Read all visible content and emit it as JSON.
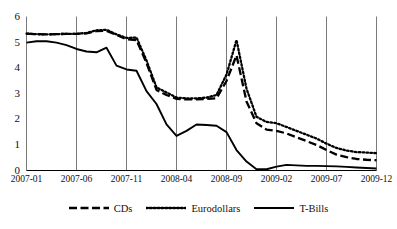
{
  "chart_data": {
    "type": "line",
    "title": "",
    "xlabel": "",
    "ylabel": "",
    "ylim": [
      0,
      6
    ],
    "yticks": [
      0,
      1,
      2,
      3,
      4,
      5,
      6
    ],
    "ytick_labels": [
      "0",
      "1",
      "2",
      "3",
      "4",
      "5",
      "6"
    ],
    "grid": true,
    "grid_axis": "x",
    "legend_position": "bottom-center",
    "x": [
      "2007-01",
      "2007-02",
      "2007-03",
      "2007-04",
      "2007-05",
      "2007-06",
      "2007-07",
      "2007-08",
      "2007-09",
      "2007-10",
      "2007-11",
      "2007-12",
      "2008-01",
      "2008-02",
      "2008-03",
      "2008-04",
      "2008-05",
      "2008-06",
      "2008-07",
      "2008-08",
      "2008-09",
      "2008-10",
      "2008-11",
      "2008-12",
      "2009-01",
      "2009-02",
      "2009-03",
      "2009-04",
      "2009-05",
      "2009-06",
      "2009-07",
      "2009-08",
      "2009-09",
      "2009-10",
      "2009-11",
      "2009-12"
    ],
    "xtick_labels": [
      "2007-01",
      "2007-06",
      "2007-11",
      "2008-04",
      "2008-09",
      "2009-02",
      "2009-07",
      "2009-12"
    ],
    "xtick_positions": [
      0,
      5,
      10,
      15,
      20,
      25,
      30,
      35
    ],
    "series": [
      {
        "name": "CDs",
        "style": "dashed",
        "color": "#000000",
        "values": [
          5.35,
          5.33,
          5.32,
          5.33,
          5.34,
          5.34,
          5.36,
          5.45,
          5.46,
          5.3,
          5.13,
          5.1,
          4.2,
          3.15,
          2.95,
          2.8,
          2.78,
          2.78,
          2.8,
          2.82,
          3.5,
          4.5,
          2.7,
          1.85,
          1.6,
          1.55,
          1.45,
          1.3,
          1.15,
          1.0,
          0.8,
          0.62,
          0.52,
          0.45,
          0.42,
          0.4
        ]
      },
      {
        "name": "Eurodollars",
        "style": "dotted",
        "color": "#000000",
        "values": [
          5.35,
          5.33,
          5.32,
          5.33,
          5.34,
          5.34,
          5.38,
          5.48,
          5.5,
          5.32,
          5.18,
          5.2,
          4.3,
          3.25,
          3.05,
          2.85,
          2.82,
          2.82,
          2.85,
          2.95,
          3.75,
          5.1,
          3.2,
          2.1,
          1.9,
          1.85,
          1.7,
          1.55,
          1.4,
          1.25,
          1.05,
          0.88,
          0.78,
          0.72,
          0.7,
          0.68
        ]
      },
      {
        "name": "T-Bills",
        "style": "solid",
        "color": "#000000",
        "values": [
          5.0,
          5.05,
          5.05,
          5.0,
          4.9,
          4.75,
          4.65,
          4.62,
          4.8,
          4.1,
          3.95,
          3.9,
          3.1,
          2.6,
          1.8,
          1.35,
          1.55,
          1.8,
          1.78,
          1.75,
          1.5,
          0.8,
          0.35,
          0.05,
          0.05,
          0.15,
          0.22,
          0.2,
          0.18,
          0.18,
          0.17,
          0.16,
          0.14,
          0.12,
          0.1,
          0.08
        ]
      }
    ]
  },
  "legend": {
    "entries": [
      {
        "label": "CDs",
        "style": "dashed"
      },
      {
        "label": "Eurodollars",
        "style": "dotted"
      },
      {
        "label": "T-Bills",
        "style": "solid"
      }
    ]
  },
  "axes": {
    "y_axis_name": "y-axis",
    "x_axis_name": "x-axis"
  }
}
